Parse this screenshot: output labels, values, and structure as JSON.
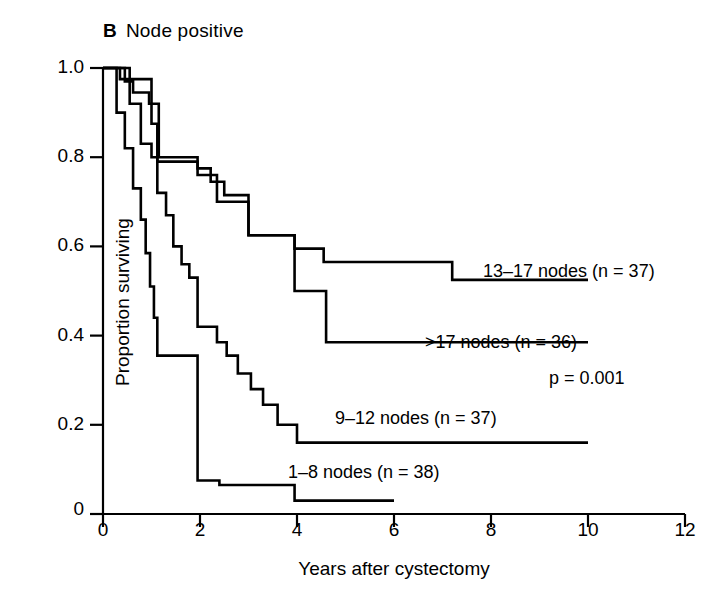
{
  "panel": {
    "letter": "B",
    "title": "Node positive"
  },
  "axes": {
    "x_title": "Years after cystectomy",
    "y_title": "Proportion surviving",
    "x_ticks": [
      "0",
      "2",
      "4",
      "6",
      "8",
      "10",
      "12"
    ],
    "y_ticks": [
      "0",
      "0.2",
      "0.4",
      "0.6",
      "0.8",
      "1.0"
    ]
  },
  "annotations": {
    "pvalue": "p = 0.001"
  },
  "curve_labels": {
    "c13_17": "13–17 nodes (n = 37)",
    "cgt17": ">17 nodes (n = 36)",
    "c9_12": "9–12 nodes (n = 37)",
    "c1_8": "1–8 nodes (n = 38)"
  },
  "style": {
    "line_color": "#000000",
    "axis_color": "#000000",
    "background": "#ffffff"
  },
  "chart_data": {
    "type": "line",
    "subtype": "kaplan-meier-step",
    "xlabel": "Years after cystectomy",
    "ylabel": "Proportion surviving",
    "xlim": [
      0,
      12
    ],
    "ylim": [
      0,
      1.0
    ],
    "xticks": [
      0,
      2,
      4,
      6,
      8,
      10,
      12
    ],
    "yticks": [
      0,
      0.2,
      0.4,
      0.6,
      0.8,
      1.0
    ],
    "grid": false,
    "legend": "inline-labels",
    "annotations": [
      {
        "text": "p = 0.001",
        "x": 9.1,
        "y": 0.3
      }
    ],
    "series": [
      {
        "name": "13–17 nodes (n = 37)",
        "n": 37,
        "label_x": 9.3,
        "label_y": 0.6,
        "points": [
          [
            0.0,
            1.0
          ],
          [
            0.45,
            1.0
          ],
          [
            0.45,
            0.97
          ],
          [
            0.62,
            0.97
          ],
          [
            0.62,
            0.945
          ],
          [
            0.95,
            0.945
          ],
          [
            0.95,
            0.92
          ],
          [
            1.15,
            0.92
          ],
          [
            1.15,
            0.8
          ],
          [
            1.95,
            0.8
          ],
          [
            1.95,
            0.775
          ],
          [
            2.22,
            0.775
          ],
          [
            2.22,
            0.745
          ],
          [
            2.5,
            0.745
          ],
          [
            2.5,
            0.715
          ],
          [
            3.0,
            0.715
          ],
          [
            3.0,
            0.625
          ],
          [
            3.95,
            0.625
          ],
          [
            3.95,
            0.595
          ],
          [
            4.55,
            0.595
          ],
          [
            4.55,
            0.565
          ],
          [
            7.2,
            0.565
          ],
          [
            7.2,
            0.525
          ],
          [
            10.0,
            0.525
          ]
        ]
      },
      {
        "name": ">17 nodes (n = 36)",
        "n": 36,
        "label_x": 9.0,
        "label_y": 0.445,
        "points": [
          [
            0.0,
            1.0
          ],
          [
            0.35,
            1.0
          ],
          [
            0.35,
            0.975
          ],
          [
            1.0,
            0.975
          ],
          [
            1.0,
            0.875
          ],
          [
            1.12,
            0.875
          ],
          [
            1.12,
            0.79
          ],
          [
            1.95,
            0.79
          ],
          [
            1.95,
            0.76
          ],
          [
            2.35,
            0.76
          ],
          [
            2.35,
            0.7
          ],
          [
            3.0,
            0.7
          ],
          [
            3.0,
            0.625
          ],
          [
            3.95,
            0.625
          ],
          [
            3.95,
            0.5
          ],
          [
            4.6,
            0.5
          ],
          [
            4.6,
            0.385
          ],
          [
            10.0,
            0.385
          ]
        ]
      },
      {
        "name": "9–12 nodes (n = 37)",
        "n": 37,
        "label_x": 6.2,
        "label_y": 0.21,
        "points": [
          [
            0.0,
            1.0
          ],
          [
            0.55,
            1.0
          ],
          [
            0.55,
            0.92
          ],
          [
            0.78,
            0.92
          ],
          [
            0.78,
            0.83
          ],
          [
            1.0,
            0.83
          ],
          [
            1.0,
            0.8
          ],
          [
            1.12,
            0.8
          ],
          [
            1.12,
            0.72
          ],
          [
            1.3,
            0.72
          ],
          [
            1.3,
            0.67
          ],
          [
            1.45,
            0.67
          ],
          [
            1.45,
            0.6
          ],
          [
            1.62,
            0.6
          ],
          [
            1.62,
            0.56
          ],
          [
            1.78,
            0.56
          ],
          [
            1.78,
            0.53
          ],
          [
            1.95,
            0.53
          ],
          [
            1.95,
            0.42
          ],
          [
            2.35,
            0.42
          ],
          [
            2.35,
            0.385
          ],
          [
            2.55,
            0.385
          ],
          [
            2.55,
            0.355
          ],
          [
            2.78,
            0.355
          ],
          [
            2.78,
            0.315
          ],
          [
            3.05,
            0.315
          ],
          [
            3.05,
            0.28
          ],
          [
            3.3,
            0.28
          ],
          [
            3.3,
            0.245
          ],
          [
            3.6,
            0.245
          ],
          [
            3.6,
            0.2
          ],
          [
            4.0,
            0.2
          ],
          [
            4.0,
            0.16
          ],
          [
            10.0,
            0.16
          ]
        ]
      },
      {
        "name": "1–8 nodes (n = 38)",
        "n": 38,
        "label_x": 3.7,
        "label_y": 0.105,
        "points": [
          [
            0.0,
            1.0
          ],
          [
            0.28,
            1.0
          ],
          [
            0.28,
            0.9
          ],
          [
            0.45,
            0.9
          ],
          [
            0.45,
            0.82
          ],
          [
            0.62,
            0.82
          ],
          [
            0.62,
            0.73
          ],
          [
            0.78,
            0.73
          ],
          [
            0.78,
            0.66
          ],
          [
            0.88,
            0.66
          ],
          [
            0.88,
            0.585
          ],
          [
            0.97,
            0.585
          ],
          [
            0.97,
            0.51
          ],
          [
            1.05,
            0.51
          ],
          [
            1.05,
            0.44
          ],
          [
            1.12,
            0.44
          ],
          [
            1.12,
            0.355
          ],
          [
            1.95,
            0.355
          ],
          [
            1.95,
            0.075
          ],
          [
            2.4,
            0.075
          ],
          [
            2.4,
            0.065
          ],
          [
            3.95,
            0.065
          ],
          [
            3.95,
            0.03
          ],
          [
            6.0,
            0.03
          ]
        ]
      }
    ]
  }
}
